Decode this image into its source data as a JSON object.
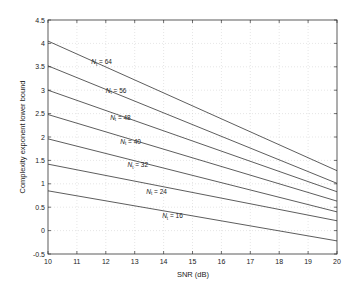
{
  "chart_data": {
    "type": "line",
    "title": "",
    "xlabel": "SNR (dB)",
    "ylabel": "Complexity exponent lower bound",
    "xlim": [
      10,
      20
    ],
    "ylim": [
      -0.5,
      4.5
    ],
    "xticks": [
      10,
      11,
      12,
      13,
      14,
      15,
      16,
      17,
      18,
      19,
      20
    ],
    "yticks": [
      -0.5,
      0,
      0.5,
      1,
      1.5,
      2,
      2.5,
      3,
      3.5,
      4,
      4.5
    ],
    "ytick_labels": [
      "-0.5",
      "0",
      "0.5",
      "1",
      "1.5",
      "2",
      "2.5",
      "3",
      "3.5",
      "4",
      "4.5"
    ],
    "grid": true,
    "legend": "inline labels",
    "x": [
      10,
      20
    ],
    "series": [
      {
        "name": "N_t = 64",
        "label_var": "N",
        "label_sub": "t",
        "label_value": "= 64",
        "values": [
          4.05,
          1.28
        ],
        "label_pos": [
          11.5,
          3.55
        ]
      },
      {
        "name": "N_t = 56",
        "label_var": "N",
        "label_sub": "t",
        "label_value": "= 56",
        "values": [
          3.52,
          1.01
        ],
        "label_pos": [
          12.0,
          2.95
        ]
      },
      {
        "name": "N_t = 48",
        "label_var": "N",
        "label_sub": "t",
        "label_value": "= 48",
        "values": [
          3.0,
          0.83
        ],
        "label_pos": [
          12.15,
          2.37
        ]
      },
      {
        "name": "N_t = 40",
        "label_var": "N",
        "label_sub": "t",
        "label_value": "= 40",
        "values": [
          2.48,
          0.63
        ],
        "label_pos": [
          12.5,
          1.86
        ]
      },
      {
        "name": "N_t = 32",
        "label_var": "N",
        "label_sub": "t",
        "label_value": "= 32",
        "values": [
          1.96,
          0.4
        ],
        "label_pos": [
          12.75,
          1.35
        ]
      },
      {
        "name": "N_t = 24",
        "label_var": "N",
        "label_sub": "t",
        "label_value": "= 24",
        "values": [
          1.42,
          0.21
        ],
        "label_pos": [
          13.4,
          0.79
        ]
      },
      {
        "name": "N_t = 16",
        "label_var": "N",
        "label_sub": "t",
        "label_value": "= 16",
        "values": [
          0.85,
          -0.22
        ],
        "label_pos": [
          13.95,
          0.26
        ]
      }
    ]
  }
}
